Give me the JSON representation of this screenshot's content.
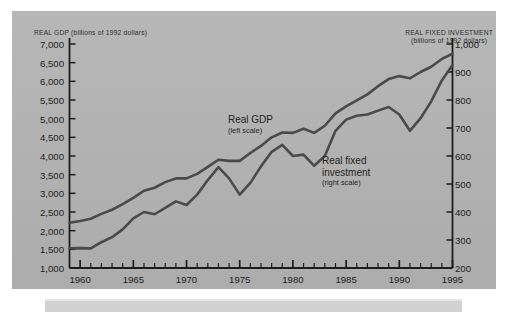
{
  "figure": {
    "background_color": "#ffffff",
    "panel_color": "#b4b4b4",
    "line_color": "#4a4a4a",
    "axis_color": "#1d1d1d",
    "caption_bar_color": "#d2d2d2"
  },
  "axes": {
    "left_title_line1": "REAL GDP (billions of 1992 dollars)",
    "right_title_line1": "REAL FIXED INVESTMENT",
    "right_title_line2": "(billions of 1992 dollars)"
  },
  "labels": {
    "gdp_name": "Real GDP",
    "gdp_scale": "(left scale)",
    "inv_name_line1": "Real fixed",
    "inv_name_line2": "investment",
    "inv_scale": "(right scale)"
  },
  "chart_data": {
    "type": "line",
    "title": "",
    "subtitle": "",
    "xlabel": "",
    "ylabel": "REAL GDP (billions of 1992 dollars)",
    "y2label": "REAL FIXED INVESTMENT (billions of 1992 dollars)",
    "grid": false,
    "legend_position": "inline-annotations",
    "xlim": [
      1959,
      1995
    ],
    "ylim": [
      1000,
      7000
    ],
    "y2lim": [
      200,
      1000
    ],
    "xticks": [
      1960,
      1965,
      1970,
      1975,
      1980,
      1985,
      1990,
      1995
    ],
    "xticklabels": [
      "1960",
      "1965",
      "1970",
      "1975",
      "1980",
      "1985",
      "1990",
      "1995"
    ],
    "x_minor_tick_interval": 1,
    "yticks": [
      1000,
      1500,
      2000,
      2500,
      3000,
      3500,
      4000,
      4500,
      5000,
      5500,
      6000,
      6500,
      7000
    ],
    "yticklabels": [
      "1,000",
      "1,500",
      "2,000",
      "2,500",
      "3,000",
      "3,500",
      "4,000",
      "4,500",
      "5,000",
      "5,500",
      "6,000",
      "6,500",
      "7,000"
    ],
    "y2ticks": [
      200,
      300,
      400,
      500,
      600,
      700,
      800,
      900,
      1000
    ],
    "y2ticklabels": [
      "200",
      "300",
      "400",
      "500",
      "600",
      "700",
      "800",
      "900",
      "1,000"
    ],
    "x": [
      1959,
      1960,
      1961,
      1962,
      1963,
      1964,
      1965,
      1966,
      1967,
      1968,
      1969,
      1970,
      1971,
      1972,
      1973,
      1974,
      1975,
      1976,
      1977,
      1978,
      1979,
      1980,
      1981,
      1982,
      1983,
      1984,
      1985,
      1986,
      1987,
      1988,
      1989,
      1990,
      1991,
      1992,
      1993,
      1994,
      1995
    ],
    "series": [
      {
        "name": "Real GDP",
        "scale": "left",
        "units": "billions of 1992 dollars",
        "values": [
          2210,
          2260,
          2320,
          2450,
          2560,
          2710,
          2880,
          3070,
          3150,
          3300,
          3400,
          3400,
          3520,
          3710,
          3900,
          3870,
          3870,
          4080,
          4270,
          4500,
          4630,
          4620,
          4730,
          4620,
          4810,
          5140,
          5330,
          5490,
          5650,
          5870,
          6060,
          6140,
          6080,
          6250,
          6390,
          6600,
          6740
        ]
      },
      {
        "name": "Real fixed investment",
        "scale": "right",
        "units": "billions of 1992 dollars",
        "values": [
          270,
          271,
          270,
          292,
          310,
          338,
          377,
          400,
          392,
          415,
          438,
          425,
          462,
          514,
          560,
          520,
          462,
          504,
          563,
          615,
          640,
          600,
          605,
          565,
          600,
          690,
          730,
          744,
          748,
          762,
          775,
          748,
          690,
          735,
          795,
          870,
          925
        ]
      }
    ],
    "annotations": [
      {
        "text": "Real GDP (left scale)",
        "x": 1978,
        "y": 5000
      },
      {
        "text": "Real fixed investment (right scale)",
        "x": 1986,
        "y": 3700
      }
    ]
  }
}
